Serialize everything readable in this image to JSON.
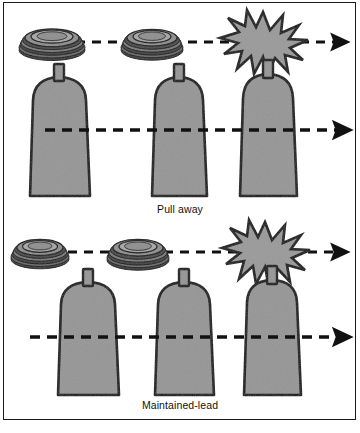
{
  "figure": {
    "background_color": "#ffffff",
    "frame_color": "#1a1a1a",
    "fill_gray": "#969696",
    "outline_color": "#111111",
    "dash_color": "#111111"
  },
  "panels": [
    {
      "id": "pull-away",
      "caption": "Pull away",
      "caption_y": 203,
      "disc_row": {
        "baseline_y": 42,
        "arrow": {
          "x_start": 60,
          "x_end": 338,
          "y": 42,
          "label": "motion-arrow"
        },
        "discs": [
          {
            "cx": 52,
            "cy": 42,
            "rx": 32,
            "ry": 11,
            "layers": 5,
            "name": "disc-stack-1"
          },
          {
            "cx": 152,
            "cy": 42,
            "rx": 30,
            "ry": 11,
            "layers": 5,
            "name": "disc-stack-2"
          }
        ],
        "impact": {
          "cx": 263,
          "cy": 42,
          "r": 28,
          "points": 12,
          "name": "impact-burst"
        }
      },
      "tooth_row": {
        "arrow": {
          "x_start": 45,
          "x_end": 340,
          "y": 130,
          "label": "motion-arrow"
        },
        "teeth": [
          {
            "cx": 59,
            "top": 82,
            "bottom": 196,
            "top_w": 62,
            "bottom_w": 50,
            "post_h": 14,
            "post_w": 9
          },
          {
            "cx": 179,
            "top": 82,
            "bottom": 196,
            "top_w": 60,
            "bottom_w": 48,
            "post_h": 14,
            "post_w": 9
          },
          {
            "cx": 268,
            "top": 80,
            "bottom": 196,
            "top_w": 60,
            "bottom_w": 52,
            "post_h": 14,
            "post_w": 9
          }
        ]
      }
    },
    {
      "id": "maintained-lead",
      "caption": "Maintained-lead",
      "caption_y": 399,
      "disc_row": {
        "baseline_y": 252,
        "arrow": {
          "x_start": 68,
          "x_end": 338,
          "y": 252,
          "label": "motion-arrow"
        },
        "discs": [
          {
            "cx": 40,
            "cy": 252,
            "rx": 28,
            "ry": 11,
            "layers": 5,
            "name": "disc-stack-1"
          },
          {
            "cx": 138,
            "cy": 252,
            "rx": 30,
            "ry": 11,
            "layers": 5,
            "name": "disc-stack-2"
          }
        ],
        "impact": {
          "cx": 265,
          "cy": 252,
          "r": 28,
          "points": 12,
          "name": "impact-burst"
        }
      },
      "tooth_row": {
        "arrow": {
          "x_start": 30,
          "x_end": 340,
          "y": 337,
          "label": "motion-arrow"
        },
        "teeth": [
          {
            "cx": 88,
            "top": 284,
            "bottom": 395,
            "top_w": 58,
            "bottom_w": 50,
            "post_h": 14,
            "post_w": 9
          },
          {
            "cx": 184,
            "top": 284,
            "bottom": 395,
            "top_w": 58,
            "bottom_w": 50,
            "post_h": 14,
            "post_w": 9
          },
          {
            "cx": 272,
            "top": 282,
            "bottom": 395,
            "top_w": 58,
            "bottom_w": 52,
            "post_h": 14,
            "post_w": 9
          }
        ]
      }
    }
  ],
  "icons": {
    "arrowhead": "arrowhead-icon",
    "disc": "disc-stack-icon",
    "burst": "impact-burst-icon",
    "tooth": "tooth-shape-icon"
  }
}
